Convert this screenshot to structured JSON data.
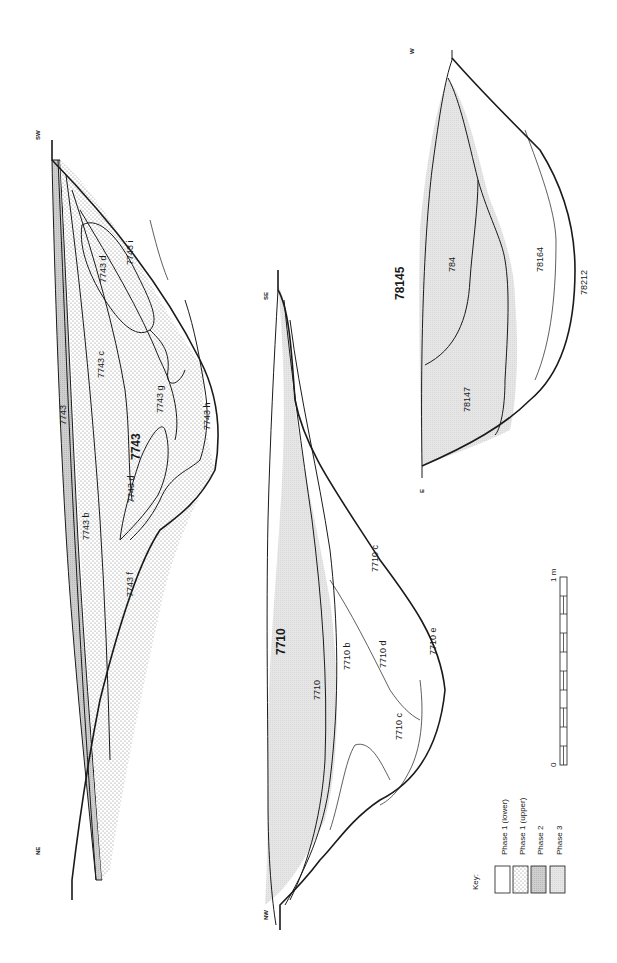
{
  "figure": {
    "orientation": "rotated 90deg clockwise (text reads bottom-to-top)",
    "colors": {
      "line": "#1a1a1a",
      "phase1_lower": "#ffffff",
      "phase1_upper_dots": "#8a8a8a",
      "phase2": "#d2d2d2",
      "phase3": "#e4e4e4",
      "background": "#ffffff"
    }
  },
  "sections": [
    {
      "id": "7743",
      "title": "7743",
      "ends": {
        "left": "NE",
        "right": "SW"
      },
      "layers": [
        {
          "label": "7743",
          "phase": "Phase 2"
        },
        {
          "label": "7743 b",
          "phase": "Phase 1 (upper)"
        },
        {
          "label": "7743 c",
          "phase": "Phase 1 (upper)"
        },
        {
          "label": "7743 d",
          "phase": "Phase 1 (upper)"
        },
        {
          "label": "7743 d",
          "phase": "Phase 1 (upper)"
        },
        {
          "label": "7743 f",
          "phase": "Phase 1 (lower)"
        },
        {
          "label": "7743 g",
          "phase": "Phase 1 (lower)"
        },
        {
          "label": "7743 h",
          "phase": "Phase 1 (lower)"
        },
        {
          "label": "7743 i",
          "phase": "Phase 1 (lower)"
        }
      ]
    },
    {
      "id": "7710",
      "title": "7710",
      "ends": {
        "left": "NW",
        "right": "SE"
      },
      "layers": [
        {
          "label": "7710",
          "phase": "Phase 3"
        },
        {
          "label": "7710 b",
          "phase": "Phase 3"
        },
        {
          "label": "7710 c",
          "phase": "Phase 1 (lower)"
        },
        {
          "label": "7710 c",
          "phase": "Phase 1 (lower)"
        },
        {
          "label": "7710 d",
          "phase": "Phase 1 (lower)"
        },
        {
          "label": "7710 e",
          "phase": "Phase 1 (lower)"
        }
      ]
    },
    {
      "id": "78145",
      "title": "78145",
      "ends": {
        "left": "E",
        "right": "W"
      },
      "layers": [
        {
          "label": "784",
          "phase": "Phase 3"
        },
        {
          "label": "78147",
          "phase": "Phase 3"
        },
        {
          "label": "78164",
          "phase": "Phase 1 (lower)"
        },
        {
          "label": "78212",
          "phase": "Phase 1 (lower)"
        }
      ]
    }
  ],
  "key": {
    "title": "Key:",
    "items": [
      {
        "label": "Phase 1 (lower)",
        "pattern": "blank"
      },
      {
        "label": "Phase 1 (upper)",
        "pattern": "dotted"
      },
      {
        "label": "Phase 2",
        "pattern": "dense-grey"
      },
      {
        "label": "Phase 3",
        "pattern": "light-grey"
      }
    ]
  },
  "scale_bar": {
    "start_label": "0",
    "end_label": "1 m",
    "divisions": 10
  }
}
